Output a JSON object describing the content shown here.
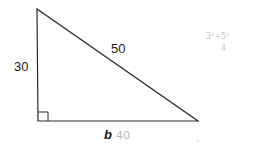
{
  "diagram": {
    "type": "right-triangle",
    "labels": {
      "left_side": "30",
      "hypotenuse": "50",
      "base": "b",
      "base_handwritten": "40",
      "handwritten_note": "3²+5²",
      "handwritten_mark": "4"
    },
    "colors": {
      "line": "#2a2a2a",
      "text": "#1a1a1a",
      "pencil": "#b8b8b8"
    }
  }
}
